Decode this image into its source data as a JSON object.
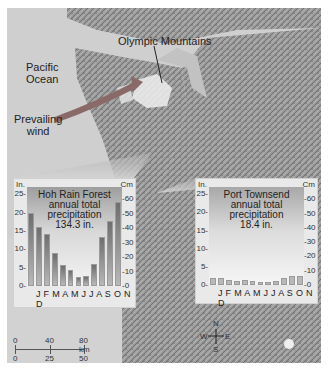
{
  "map": {
    "labels": {
      "ocean": "Pacific\nOcean",
      "ocean_line1": "Pacific",
      "ocean_line2": "Ocean",
      "mountains": "Olympic Mountains",
      "wind_line1": "Prevailing",
      "wind_line2": "wind"
    },
    "scale_bar": {
      "km_ticks": [
        "0",
        "40",
        "80 km"
      ],
      "mi_ticks": [
        "0",
        "25",
        "50 mi"
      ]
    },
    "compass": {
      "n": "N",
      "s": "S",
      "e": "E",
      "w": "W"
    },
    "colors": {
      "wind_arrow": "#8a6a68",
      "callout": "#bdbdbd"
    }
  },
  "chart_data": [
    {
      "type": "bar",
      "title": "Hoh Rain Forest annual total precipitation 134.3 in.",
      "title_lines": [
        "Hoh Rain Forest",
        "annual total",
        "precipitation",
        "134.3 in."
      ],
      "categories": [
        "J",
        "F",
        "M",
        "A",
        "M",
        "J",
        "J",
        "A",
        "S",
        "O",
        "N",
        "D"
      ],
      "values": [
        20,
        16,
        14.2,
        9.1,
        5.8,
        4.3,
        2.5,
        2.6,
        6,
        13.4,
        17.6,
        23
      ],
      "xlabel": "",
      "ylabel_left": "In.",
      "ylabel_right": "Cm",
      "ylim": [
        0,
        27
      ],
      "left_ticks": [
        "0",
        "5",
        "10",
        "15",
        "20",
        "25"
      ],
      "right_ticks": [
        "0",
        "10",
        "20",
        "30",
        "40",
        "50",
        "60"
      ],
      "grid": false
    },
    {
      "type": "bar",
      "title": "Port Townsend annual total precipitation 18.4 in.",
      "title_lines": [
        "Port Townsend",
        "annual total",
        "precipitation",
        "18.4 in."
      ],
      "categories": [
        "J",
        "F",
        "M",
        "A",
        "M",
        "J",
        "J",
        "A",
        "S",
        "O",
        "N",
        "D"
      ],
      "values": [
        2.0,
        1.8,
        1.5,
        1.2,
        1.3,
        1.2,
        0.7,
        0.8,
        1.2,
        1.8,
        2.6,
        2.5
      ],
      "xlabel": "",
      "ylabel_left": "In.",
      "ylabel_right": "Cm",
      "ylim": [
        0,
        27
      ],
      "left_ticks": [
        "0",
        "5",
        "10",
        "15",
        "20",
        "25"
      ],
      "right_ticks": [
        "0",
        "10",
        "20",
        "30",
        "40",
        "50",
        "60"
      ],
      "grid": false
    }
  ],
  "month_string": "J F M A M J J A S O N D"
}
